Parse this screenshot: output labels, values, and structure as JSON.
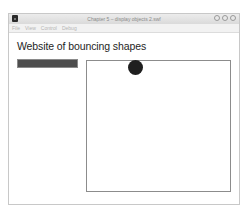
{
  "window": {
    "title": "Chapter 5 – display objects 2.swf",
    "app_icon": "flash-player-icon",
    "controls": [
      "minimize",
      "zoom",
      "close"
    ]
  },
  "menubar": {
    "items": [
      {
        "label": "File"
      },
      {
        "label": "View"
      },
      {
        "label": "Control"
      },
      {
        "label": "Debug"
      }
    ]
  },
  "page": {
    "heading": "Website of bouncing shapes",
    "nav_bar_color": "#4d4d4d",
    "stage": {
      "shape": "circle",
      "shape_color": "#1f1f1f"
    }
  }
}
